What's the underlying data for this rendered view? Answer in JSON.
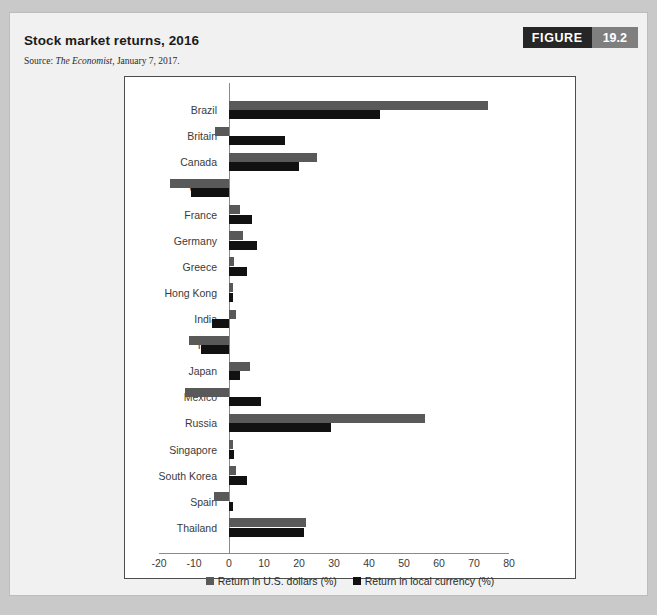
{
  "figure": {
    "title": "Stock market returns, 2016",
    "source_prefix": "Source: ",
    "source_italic": "The Economist",
    "source_suffix": ", January 7, 2017.",
    "badge_label": "FIGURE",
    "badge_number": "19.2"
  },
  "colors": {
    "usd_series": "#595959",
    "local_series": "#111111",
    "card_background": "#f1f1f1",
    "plot_background": "#ffffff",
    "badge_dark": "#262626",
    "badge_gray": "#7f7f7f"
  },
  "chart_data": {
    "type": "bar",
    "orientation": "horizontal",
    "title": "Stock market returns, 2016",
    "xlabel": "",
    "ylabel": "",
    "xlim": [
      -20,
      80
    ],
    "xticks": [
      -20,
      -10,
      0,
      10,
      20,
      30,
      40,
      50,
      60,
      70,
      80
    ],
    "xtick_labels": [
      "-20",
      "-10",
      "0",
      "10",
      "20",
      "30",
      "40",
      "50",
      "60",
      "70",
      "80"
    ],
    "grid": false,
    "legend_position": "bottom",
    "categories": [
      "Brazil",
      "Britain",
      "Canada",
      "China",
      "France",
      "Germany",
      "Greece",
      "Hong Kong",
      "India",
      "Italy",
      "Japan",
      "Mexico",
      "Russia",
      "Singapore",
      "South Korea",
      "Spain",
      "Thailand"
    ],
    "series": [
      {
        "name": "Return in U.S. dollars (%)",
        "color": "#595959",
        "values": [
          74,
          -4,
          25,
          -17,
          3,
          4,
          1.5,
          1,
          2,
          -11.5,
          6,
          -12.7,
          56,
          1,
          2,
          -4.3,
          22
        ]
      },
      {
        "name": "Return in local currency (%)",
        "color": "#111111",
        "values": [
          43,
          16,
          20,
          -11,
          6.5,
          8,
          5,
          1.2,
          -5,
          -8,
          3,
          9,
          29,
          1.5,
          5,
          1,
          21.5
        ]
      }
    ]
  }
}
